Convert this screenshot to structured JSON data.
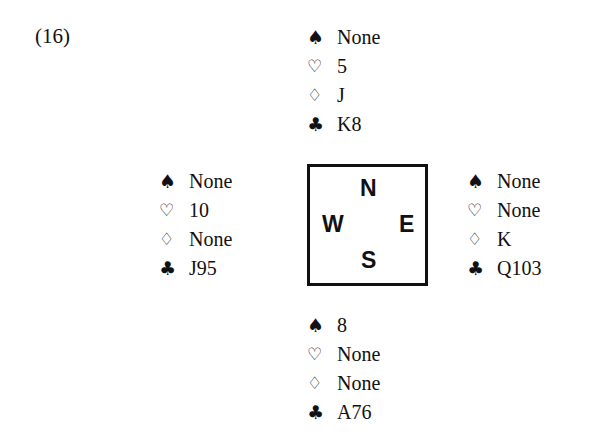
{
  "problem_label": "(16)",
  "suit_symbols": {
    "spades": "♠",
    "hearts": "♡",
    "diamonds": "♢",
    "clubs": "♣"
  },
  "compass": {
    "n": "N",
    "s": "S",
    "w": "W",
    "e": "E"
  },
  "hands": {
    "north": {
      "spades": "None",
      "hearts": "5",
      "diamonds": "J",
      "clubs": "K8"
    },
    "west": {
      "spades": "None",
      "hearts": "10",
      "diamonds": "None",
      "clubs": "J95"
    },
    "east": {
      "spades": "None",
      "hearts": "None",
      "diamonds": "K",
      "clubs": "Q103"
    },
    "south": {
      "spades": "8",
      "hearts": "None",
      "diamonds": "None",
      "clubs": "A76"
    }
  }
}
